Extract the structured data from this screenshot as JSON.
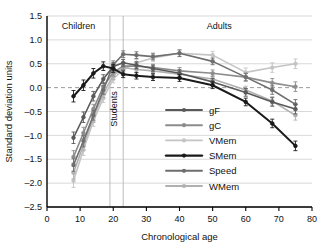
{
  "chart_data": {
    "type": "line",
    "title": "",
    "xlabel": "Chronological age",
    "ylabel": "Standard deviation units",
    "xlim": [
      0,
      80
    ],
    "ylim": [
      -2.5,
      1.5
    ],
    "xticks": [
      0,
      10,
      20,
      30,
      40,
      50,
      60,
      70,
      80
    ],
    "yticks": [
      1.5,
      1.0,
      0.5,
      0.0,
      -0.5,
      -1.0,
      -1.5,
      -2.0,
      -2.5
    ],
    "xtick_labels": [
      "0",
      "10",
      "20",
      "30",
      "40",
      "50",
      "60",
      "70",
      "80"
    ],
    "ytick_labels": [
      "1.5",
      "1.0",
      "0.5",
      "0.0",
      "-0.5",
      "-1.0",
      "-1.5",
      "-2.0",
      "-2.5"
    ],
    "grid": true,
    "zero_reference_line": 0.0,
    "legend_position": "inside-lower-right",
    "annotations": [
      {
        "text": "Children",
        "x": 9.5,
        "y": 1.22,
        "orientation": "horizontal"
      },
      {
        "text": "Students",
        "x": 21.0,
        "y": -0.45,
        "orientation": "vertical"
      },
      {
        "text": "Adults",
        "x": 52.0,
        "y": 1.22,
        "orientation": "horizontal"
      }
    ],
    "vertical_dividers": [
      19.0,
      23.0
    ],
    "error_bars": true,
    "series": [
      {
        "name": "gF",
        "color": "#595959",
        "marker": "circle",
        "x": [
          8,
          11,
          14,
          17,
          20,
          23,
          27,
          32,
          40,
          50,
          60,
          68,
          75
        ],
        "values": [
          -1.05,
          -0.62,
          -0.18,
          0.18,
          0.44,
          0.52,
          0.47,
          0.4,
          0.3,
          0.12,
          -0.1,
          -0.3,
          -0.45
        ],
        "errors": [
          0.12,
          0.11,
          0.1,
          0.09,
          0.08,
          0.07,
          0.07,
          0.07,
          0.07,
          0.07,
          0.08,
          0.09,
          0.1
        ]
      },
      {
        "name": "gC",
        "color": "#8c8c8c",
        "marker": "circle",
        "x": [
          8,
          11,
          14,
          17,
          20,
          23,
          27,
          32,
          40,
          50,
          60,
          68,
          75
        ],
        "values": [
          -1.45,
          -0.95,
          -0.45,
          0.02,
          0.32,
          0.45,
          0.45,
          0.42,
          0.35,
          0.3,
          0.22,
          0.1,
          0.02
        ],
        "errors": [
          0.13,
          0.12,
          0.1,
          0.09,
          0.08,
          0.07,
          0.07,
          0.07,
          0.07,
          0.07,
          0.08,
          0.09,
          0.1
        ]
      },
      {
        "name": "VMem",
        "color": "#c4c4c4",
        "marker": "circle",
        "x": [
          8,
          11,
          14,
          17,
          20,
          23,
          27,
          32,
          40,
          50,
          60,
          68,
          75
        ],
        "values": [
          -1.95,
          -1.3,
          -0.7,
          -0.22,
          0.18,
          0.38,
          0.52,
          0.62,
          0.72,
          0.68,
          0.32,
          0.42,
          0.5
        ],
        "errors": [
          0.14,
          0.12,
          0.11,
          0.09,
          0.08,
          0.08,
          0.07,
          0.07,
          0.07,
          0.08,
          0.09,
          0.1,
          0.1
        ]
      },
      {
        "name": "SMem",
        "color": "#1a1a1a",
        "marker": "circle",
        "x": [
          8,
          11,
          14,
          17,
          20,
          23,
          27,
          32,
          40,
          50,
          60,
          68,
          75
        ],
        "values": [
          -0.18,
          0.05,
          0.3,
          0.45,
          0.4,
          0.28,
          0.25,
          0.22,
          0.2,
          0.05,
          -0.3,
          -0.75,
          -1.22
        ],
        "errors": [
          0.12,
          0.11,
          0.1,
          0.09,
          0.08,
          0.07,
          0.07,
          0.07,
          0.07,
          0.07,
          0.08,
          0.09,
          0.1
        ]
      },
      {
        "name": "Speed",
        "color": "#6e6e6e",
        "marker": "circle",
        "x": [
          8,
          11,
          14,
          17,
          20,
          23,
          27,
          32,
          40,
          50,
          60,
          68,
          75
        ],
        "values": [
          -1.62,
          -1.12,
          -0.58,
          -0.05,
          0.48,
          0.7,
          0.68,
          0.65,
          0.72,
          0.55,
          0.22,
          -0.05,
          -0.35
        ],
        "errors": [
          0.13,
          0.12,
          0.1,
          0.09,
          0.08,
          0.07,
          0.07,
          0.07,
          0.07,
          0.07,
          0.08,
          0.09,
          0.1
        ]
      },
      {
        "name": "WMem",
        "color": "#b0b0b0",
        "marker": "circle",
        "x": [
          8,
          11,
          14,
          17,
          20,
          23,
          27,
          32,
          40,
          50,
          60,
          68,
          75
        ],
        "values": [
          -1.78,
          -1.2,
          -0.62,
          -0.12,
          0.25,
          0.42,
          0.38,
          0.35,
          0.28,
          0.18,
          -0.05,
          -0.28,
          -0.58
        ],
        "errors": [
          0.13,
          0.12,
          0.11,
          0.09,
          0.08,
          0.07,
          0.07,
          0.07,
          0.07,
          0.07,
          0.08,
          0.09,
          0.1
        ]
      }
    ]
  },
  "legend": {
    "entries": [
      {
        "label": "gF"
      },
      {
        "label": "gC"
      },
      {
        "label": "VMem"
      },
      {
        "label": "SMem"
      },
      {
        "label": "Speed"
      },
      {
        "label": "WMem"
      }
    ]
  }
}
